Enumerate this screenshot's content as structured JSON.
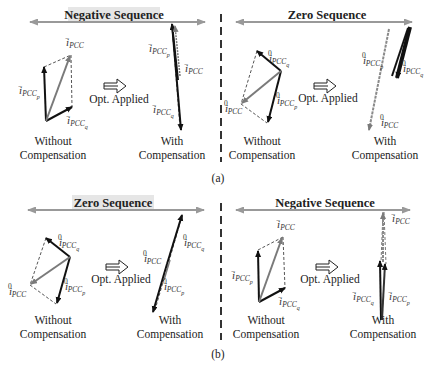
{
  "panels": {
    "a": {
      "label": "(a)",
      "left": {
        "title": "Negative Sequence",
        "before_caption_line1": "Without",
        "before_caption_line2": "Compensation",
        "after_caption_line1": "With",
        "after_caption_line2": "Compensation",
        "opt_label": "Opt. Applied",
        "vectors_before": [
          "i⁻PCC",
          "i⁻PCCp",
          "i⁻PCCq"
        ],
        "vectors_after": [
          "i⁻PCCp",
          "i⁻PCC",
          "i⁻PCCq"
        ]
      },
      "right": {
        "title": "Zero Sequence",
        "before_caption_line1": "Without",
        "before_caption_line2": "Compensation",
        "after_caption_line1": "With",
        "after_caption_line2": "Compensation",
        "opt_label": "Opt. Applied",
        "vectors_before": [
          "i⁰PCCq",
          "i⁰PCC",
          "i⁰PCCp"
        ],
        "vectors_after": [
          "i⁰PCCp",
          "i⁰PCCq",
          "i⁰PCC"
        ]
      }
    },
    "b": {
      "label": "(b)",
      "left": {
        "title": "Zero Sequence",
        "before_caption_line1": "Without",
        "before_caption_line2": "Compensation",
        "after_caption_line1": "With",
        "after_caption_line2": "Compensation",
        "opt_label": "Opt. Applied",
        "vectors_before": [
          "i⁰PCCq",
          "i⁰PCC",
          "i⁰PCCp"
        ],
        "vectors_after": [
          "i⁰PCCq",
          "i⁰PCC",
          "i⁰PCCp"
        ]
      },
      "right": {
        "title": "Negative Sequence",
        "before_caption_line1": "Without",
        "before_caption_line2": "Compensation",
        "after_caption_line1": "With",
        "after_caption_line2": "Compensation",
        "opt_label": "Opt. Applied",
        "vectors_before": [
          "i⁻PCC",
          "i⁻PCCp",
          "i⁻PCCq"
        ],
        "vectors_after": [
          "i⁻PCC",
          "i⁻PCCq",
          "i⁻PCCp"
        ]
      }
    }
  },
  "label_parts": {
    "i": "i",
    "minus": "−",
    "zero": "0",
    "pcc": "PCC",
    "p": "p",
    "q": "q"
  },
  "colors": {
    "axis_arrow": "#999999",
    "title_bg": "#e6e6e6",
    "vec_dark": "#111111",
    "vec_gray": "#7a7a7a",
    "dashed": "#555555",
    "divider": "#333333"
  }
}
